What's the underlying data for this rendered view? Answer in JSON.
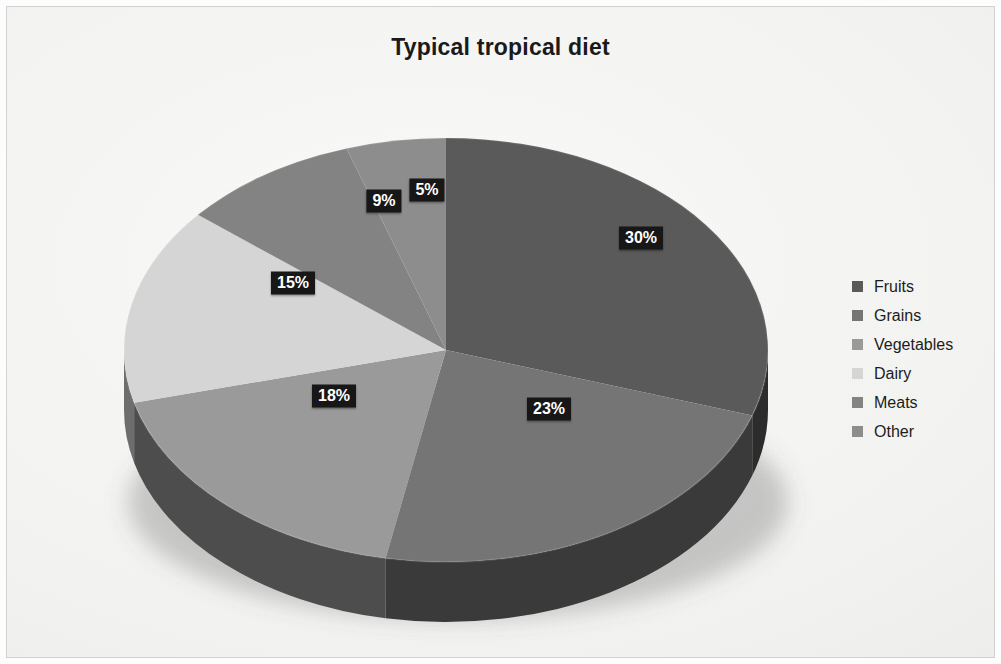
{
  "chart_data": {
    "type": "pie",
    "title": "Typical tropical diet",
    "three_d": true,
    "legend_position": "right",
    "categories": [
      "Fruits",
      "Grains",
      "Vegetables",
      "Dairy",
      "Meats",
      "Other"
    ],
    "values": [
      30,
      23,
      18,
      15,
      9,
      5
    ],
    "labels": [
      "30%",
      "23%",
      "18%",
      "15%",
      "9%",
      "5%"
    ],
    "unit": "%",
    "colors": [
      "#5a5a5a",
      "#757575",
      "#9a9a9a",
      "#d5d5d5",
      "#838383",
      "#8d8d8d"
    ],
    "slices": [
      {
        "name": "Fruits",
        "value": 30,
        "label": "30%",
        "color": "#5a5a5a",
        "side_color": "#2c2c2c"
      },
      {
        "name": "Grains",
        "value": 23,
        "label": "23%",
        "color": "#757575",
        "side_color": "#3a3a3a"
      },
      {
        "name": "Vegetables",
        "value": 18,
        "label": "18%",
        "color": "#9a9a9a",
        "side_color": "#4d4d4d"
      },
      {
        "name": "Dairy",
        "value": 15,
        "label": "15%",
        "color": "#d5d5d5",
        "side_color": "#6d6d6d"
      },
      {
        "name": "Meats",
        "value": 9,
        "label": "9%",
        "color": "#838383",
        "side_color": "#434343"
      },
      {
        "name": "Other",
        "value": 5,
        "label": "5%",
        "color": "#8d8d8d",
        "side_color": "#464646"
      }
    ]
  },
  "title": "Typical tropical diet",
  "legend": {
    "items": [
      {
        "label": "Fruits",
        "color": "#5a5a5a"
      },
      {
        "label": "Grains",
        "color": "#757575"
      },
      {
        "label": "Vegetables",
        "color": "#9a9a9a"
      },
      {
        "label": "Dairy",
        "color": "#d5d5d5"
      },
      {
        "label": "Meats",
        "color": "#838383"
      },
      {
        "label": "Other",
        "color": "#8d8d8d"
      }
    ]
  },
  "labels": {
    "fruits": "30%",
    "grains": "23%",
    "vegetables": "18%",
    "dairy": "15%",
    "meats": "9%",
    "other": "5%"
  }
}
